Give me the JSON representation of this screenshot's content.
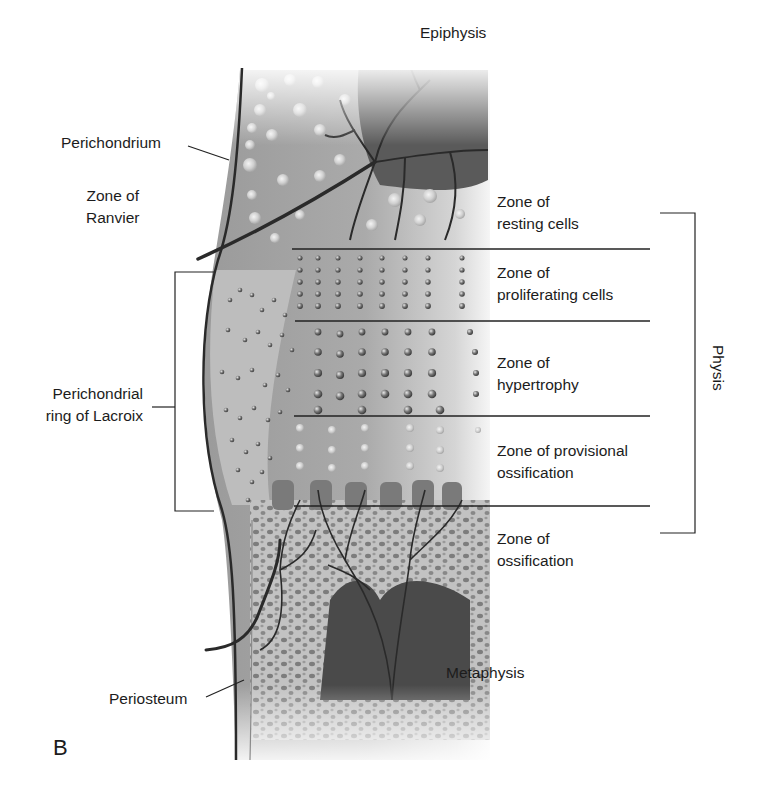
{
  "figure": {
    "panel_letter": "B",
    "regions": {
      "top": "Epiphysis",
      "bottom": "Metaphysis"
    },
    "left_labels": {
      "perichondrium": "Perichondrium",
      "zone_of_ranvier": [
        "Zone of",
        "Ranvier"
      ],
      "perichondrial_ring": [
        "Perichondrial",
        "ring of Lacroix"
      ],
      "periosteum": "Periosteum"
    },
    "zones": [
      {
        "id": "resting",
        "lines": [
          "Zone of",
          "resting cells"
        ]
      },
      {
        "id": "proliferating",
        "lines": [
          "Zone of",
          "proliferating cells"
        ]
      },
      {
        "id": "hypertrophy",
        "lines": [
          "Zone of",
          "hypertrophy"
        ]
      },
      {
        "id": "provisional",
        "lines": [
          "Zone of provisional",
          "ossification"
        ]
      },
      {
        "id": "ossification",
        "lines": [
          "Zone of",
          "ossification"
        ]
      }
    ],
    "bracket_label": "Physis",
    "colors": {
      "background": "#ffffff",
      "text": "#1c1c1c",
      "line": "#222222",
      "cartilage": "#b8b8b8",
      "dark_tissue": "#555555",
      "vessel": "#2a2a2a"
    }
  }
}
